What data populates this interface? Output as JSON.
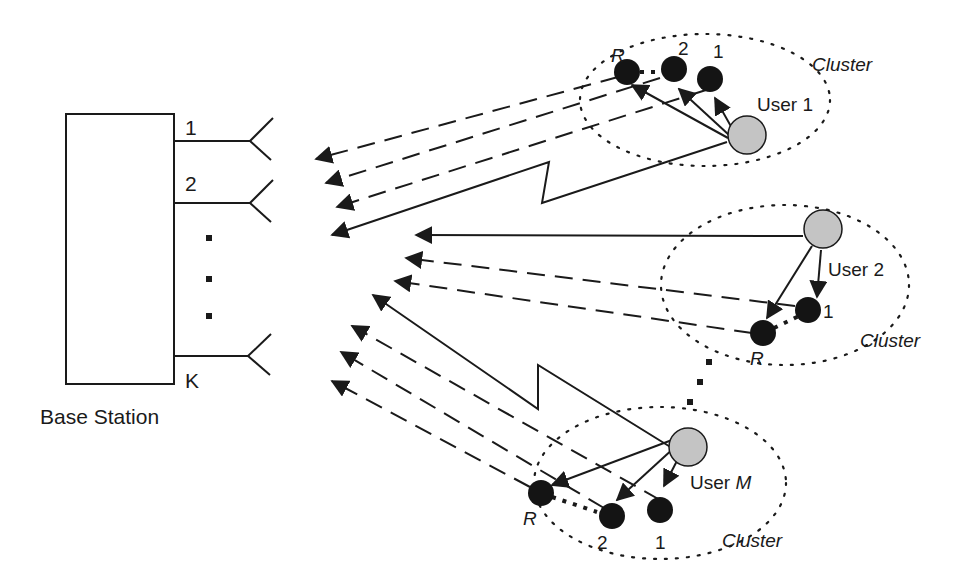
{
  "base_station": {
    "label": "Base Station",
    "antennas": [
      {
        "label": "1",
        "y": 141
      },
      {
        "label": "2",
        "y": 203
      },
      {
        "label": "K",
        "y": 356
      }
    ],
    "ellipsis": "⋮"
  },
  "users": [
    {
      "name": "User 1",
      "name_prefix": "User ",
      "name_suffix": "1",
      "cluster_label": "Cluster",
      "relays": [
        {
          "label": "R"
        },
        {
          "label": "2"
        },
        {
          "label": "1"
        }
      ]
    },
    {
      "name": "User 2",
      "name_prefix": "User ",
      "name_suffix": "2",
      "cluster_label": "Cluster",
      "relays": [
        {
          "label": "1"
        },
        {
          "label": "R"
        }
      ]
    },
    {
      "name": "User M",
      "name_prefix": "User ",
      "name_suffix": "M",
      "cluster_label": "Cluster",
      "relays": [
        {
          "label": "R"
        },
        {
          "label": "2"
        },
        {
          "label": "1"
        }
      ]
    }
  ],
  "colors": {
    "user_node": "#c4c4c4",
    "relay_node": "#141414",
    "line": "#1a1a1a",
    "background": "#ffffff"
  },
  "legend": {
    "solid_line": "direct user-to-base-station link",
    "dashed_line": "relay-to-base-station link",
    "dotted_ellipse": "cluster boundary"
  }
}
